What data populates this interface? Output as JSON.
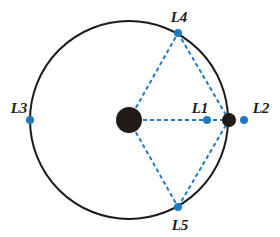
{
  "diagram": {
    "colors": {
      "orbit": "#1a1a1a",
      "body": "#231a18",
      "point": "#1f78c1",
      "dash": "#1f78c1",
      "label": "#1a1a1a"
    },
    "orbit": {
      "cx": 129,
      "cy": 120,
      "r": 99
    },
    "bodies": [
      {
        "id": "primary",
        "cx": 129,
        "cy": 120,
        "r": 13
      },
      {
        "id": "secondary",
        "cx": 229,
        "cy": 120,
        "r": 7
      }
    ],
    "points": [
      {
        "id": "L1",
        "label": "L1",
        "cx": 207,
        "cy": 120,
        "lx": 200,
        "ly": 113
      },
      {
        "id": "L2",
        "label": "L2",
        "cx": 244,
        "cy": 120,
        "lx": 261,
        "ly": 113
      },
      {
        "id": "L3",
        "label": "L3",
        "cx": 30,
        "cy": 120,
        "lx": 19,
        "ly": 113
      },
      {
        "id": "L4",
        "label": "L4",
        "cx": 178,
        "cy": 33,
        "lx": 179,
        "ly": 22
      },
      {
        "id": "L5",
        "label": "L5",
        "cx": 178,
        "cy": 207,
        "lx": 180,
        "ly": 230
      }
    ]
  }
}
